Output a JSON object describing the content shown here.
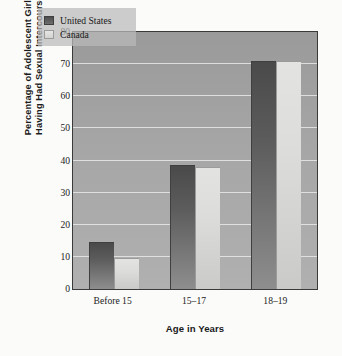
{
  "chart_data": {
    "type": "bar",
    "title": "",
    "subtitle": "",
    "xlabel": "Age in Years",
    "ylabel": "Percentage of Adolescent Girls Having Had Sexual Intercourse",
    "ylabel_lines": [
      "Percentage of Adolescent Girls",
      "Having Had Sexual Intercourse"
    ],
    "categories": [
      "Before 15",
      "15–17",
      "18–19"
    ],
    "series": [
      {
        "name": "United States",
        "values": [
          14.5,
          38.5,
          71
        ],
        "color": "#555555"
      },
      {
        "name": "Canada",
        "values": [
          9.5,
          38,
          71
        ],
        "color": "#dcdcda"
      }
    ],
    "ylim": [
      0,
      80
    ],
    "ytick_values": [
      0,
      10,
      20,
      30,
      40,
      50,
      60,
      70,
      80
    ],
    "ytick_labels": [
      "0",
      "10",
      "20",
      "30",
      "40",
      "50",
      "60",
      "70",
      "80"
    ],
    "grid": true,
    "grid_color": "#e9e9e6",
    "legend_position": "top-left-inside",
    "plot_background": "#a6a6a6",
    "figure_background": "#fbfbfa",
    "axis_color": "#3a3a3a"
  },
  "legend": {
    "entries": [
      {
        "label": "United States"
      },
      {
        "label": "Canada"
      }
    ]
  }
}
